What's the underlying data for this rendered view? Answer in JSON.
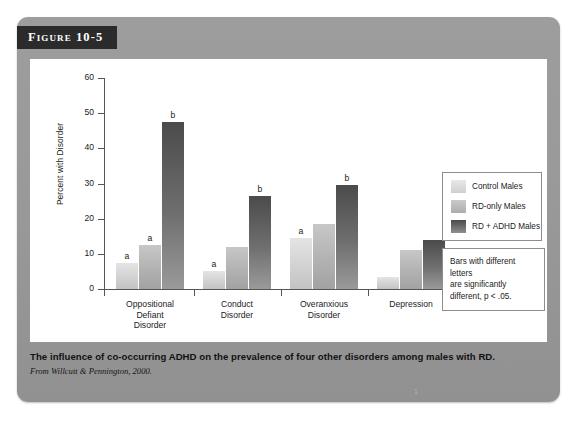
{
  "figure": {
    "badge_label": "Figure 10-5",
    "caption": "The influence of co-occurring ADHD on the prevalence of four other disorders among males with RD.",
    "source": "From Willcutt & Pennington, 2000.",
    "page_mark": "1"
  },
  "legend": {
    "items": [
      {
        "label": "Control Males",
        "color": "#d2d2d2",
        "swatch": "c0"
      },
      {
        "label": "RD-only Males",
        "color": "#b2b2b2",
        "swatch": "c1"
      },
      {
        "label": "RD + ADHD Males",
        "color": "#5a5a5a",
        "swatch": "c2"
      }
    ]
  },
  "note": {
    "line1": "Bars with different letters",
    "line2": "are significantly",
    "line3": "different, p < .05."
  },
  "chart_data": {
    "type": "bar",
    "title": "",
    "xlabel": "",
    "ylabel": "Percent with Disorder",
    "ylim": [
      0,
      60
    ],
    "yticks": [
      0,
      10,
      20,
      30,
      40,
      50,
      60
    ],
    "ytick_labels": [
      "0",
      "10",
      "20",
      "30",
      "40",
      "50",
      "60"
    ],
    "grid": false,
    "legend_position": "right",
    "categories": [
      "Oppositional Defiant Disorder",
      "Conduct Disorder",
      "Overanxious Disorder",
      "Depression"
    ],
    "category_lines": [
      [
        "Oppositional",
        "Defiant",
        "Disorder"
      ],
      [
        "Conduct",
        "Disorder"
      ],
      [
        "Overanxious",
        "Disorder"
      ],
      [
        "Depression"
      ]
    ],
    "series": [
      {
        "name": "Control Males",
        "values": [
          7.5,
          5.0,
          14.5,
          3.5
        ]
      },
      {
        "name": "RD-only Males",
        "values": [
          12.5,
          12.0,
          18.5,
          11.0
        ]
      },
      {
        "name": "RD + ADHD Males",
        "values": [
          47.5,
          26.5,
          29.5,
          14.0
        ]
      }
    ],
    "annotations": [
      {
        "category": "Oppositional Defiant Disorder",
        "series": "Control Males",
        "text": "a"
      },
      {
        "category": "Oppositional Defiant Disorder",
        "series": "RD-only Males",
        "text": "a"
      },
      {
        "category": "Oppositional Defiant Disorder",
        "series": "RD + ADHD Males",
        "text": "b"
      },
      {
        "category": "Conduct Disorder",
        "series": "Control Males",
        "text": "a"
      },
      {
        "category": "Conduct Disorder",
        "series": "RD + ADHD Males",
        "text": "b"
      },
      {
        "category": "Overanxious Disorder",
        "series": "Control Males",
        "text": "a"
      },
      {
        "category": "Overanxious Disorder",
        "series": "RD + ADHD Males",
        "text": "b"
      }
    ],
    "bar_letters": [
      [
        "a",
        "a",
        "b"
      ],
      [
        "a",
        "",
        "b"
      ],
      [
        "a",
        "",
        "b"
      ],
      [
        "",
        "",
        ""
      ]
    ]
  }
}
